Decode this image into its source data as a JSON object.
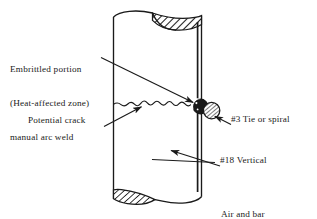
{
  "figure": {
    "type": "engineering-diagram",
    "background_color": "#ffffff",
    "line_color": "#1a1a1a",
    "hatch_color": "#1a1a1a"
  },
  "labels": {
    "embrittled": {
      "line1": "Embrittled portion",
      "line2": "(Heat-affected zone)",
      "line3": "manual arc weld"
    },
    "potential_crack": "Potential crack",
    "tie_or_spiral": "#3 Tie or spiral",
    "vertical_bar": "#18 Vertical",
    "temperatures": {
      "line1": "Air and bar",
      "line2": "temperatures-cold"
    }
  },
  "elements": {
    "column": "concrete-column-body",
    "column_top_break": "torn-break-top-hatched",
    "column_bottom_break": "torn-break-bottom-hatched",
    "crack": "wavy-potential-crack-line",
    "weld_detail": "weld-bar-intersection-circle",
    "tie_bar": "hatched-tie-bar-circle",
    "vertical_bar_line": "vertical-reinforcing-bar"
  },
  "leaders": {
    "embrittled_to_weld": "arrow-pointing-right-down-to-weld",
    "crack_to_crackline": "arrow-pointing-right-up-to-crack",
    "tie_to_circle": "arrow-pointing-left-up-to-tie-circle",
    "vertical_to_column": "arrow-pointing-left-up-into-column"
  }
}
